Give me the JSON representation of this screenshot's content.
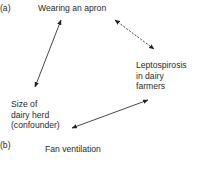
{
  "panel_a": {
    "label": "(a)",
    "exposure": "Wearing an apron",
    "outcome": "Leptospirosis\nin dairy\nfarmers",
    "confounder": "Size of\ndairy herd\n(confounder)",
    "arrows": [
      {
        "from": "confounder",
        "to": "exposure",
        "style": "solid",
        "bidirectional": true
      },
      {
        "from": "exposure",
        "to": "outcome",
        "style": "dashed",
        "bidirectional": true
      },
      {
        "from": "confounder",
        "to": "outcome",
        "style": "solid",
        "bidirectional": true
      }
    ]
  },
  "panel_b": {
    "label": "(b)",
    "exposure_partial": "Fan ventilation"
  }
}
